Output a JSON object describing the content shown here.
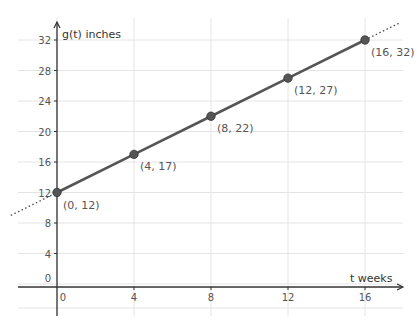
{
  "chart_data": {
    "type": "line",
    "title": "",
    "xlabel": "t weeks",
    "ylabel": "g(t) inches",
    "xlim": [
      -2,
      18
    ],
    "ylim": [
      -4,
      34
    ],
    "x_ticks": [
      0,
      4,
      8,
      12,
      16
    ],
    "y_ticks": [
      0,
      4,
      8,
      12,
      16,
      20,
      24,
      28,
      32
    ],
    "grid": true,
    "series": [
      {
        "name": "g(t)",
        "x": [
          0,
          4,
          8,
          12,
          16
        ],
        "y": [
          12,
          17,
          22,
          27,
          32
        ],
        "point_labels": [
          "(0, 12)",
          "(4, 17)",
          "(8, 22)",
          "(12, 27)",
          "(16, 32)"
        ],
        "extension": "dotted beyond endpoints"
      }
    ],
    "colors": {
      "line": "#555555",
      "point": "#555555",
      "grid": "#e4e4e4",
      "axis": "#333333"
    }
  },
  "labels": {
    "x_axis": "t weeks",
    "y_axis": "g(t) inches"
  }
}
